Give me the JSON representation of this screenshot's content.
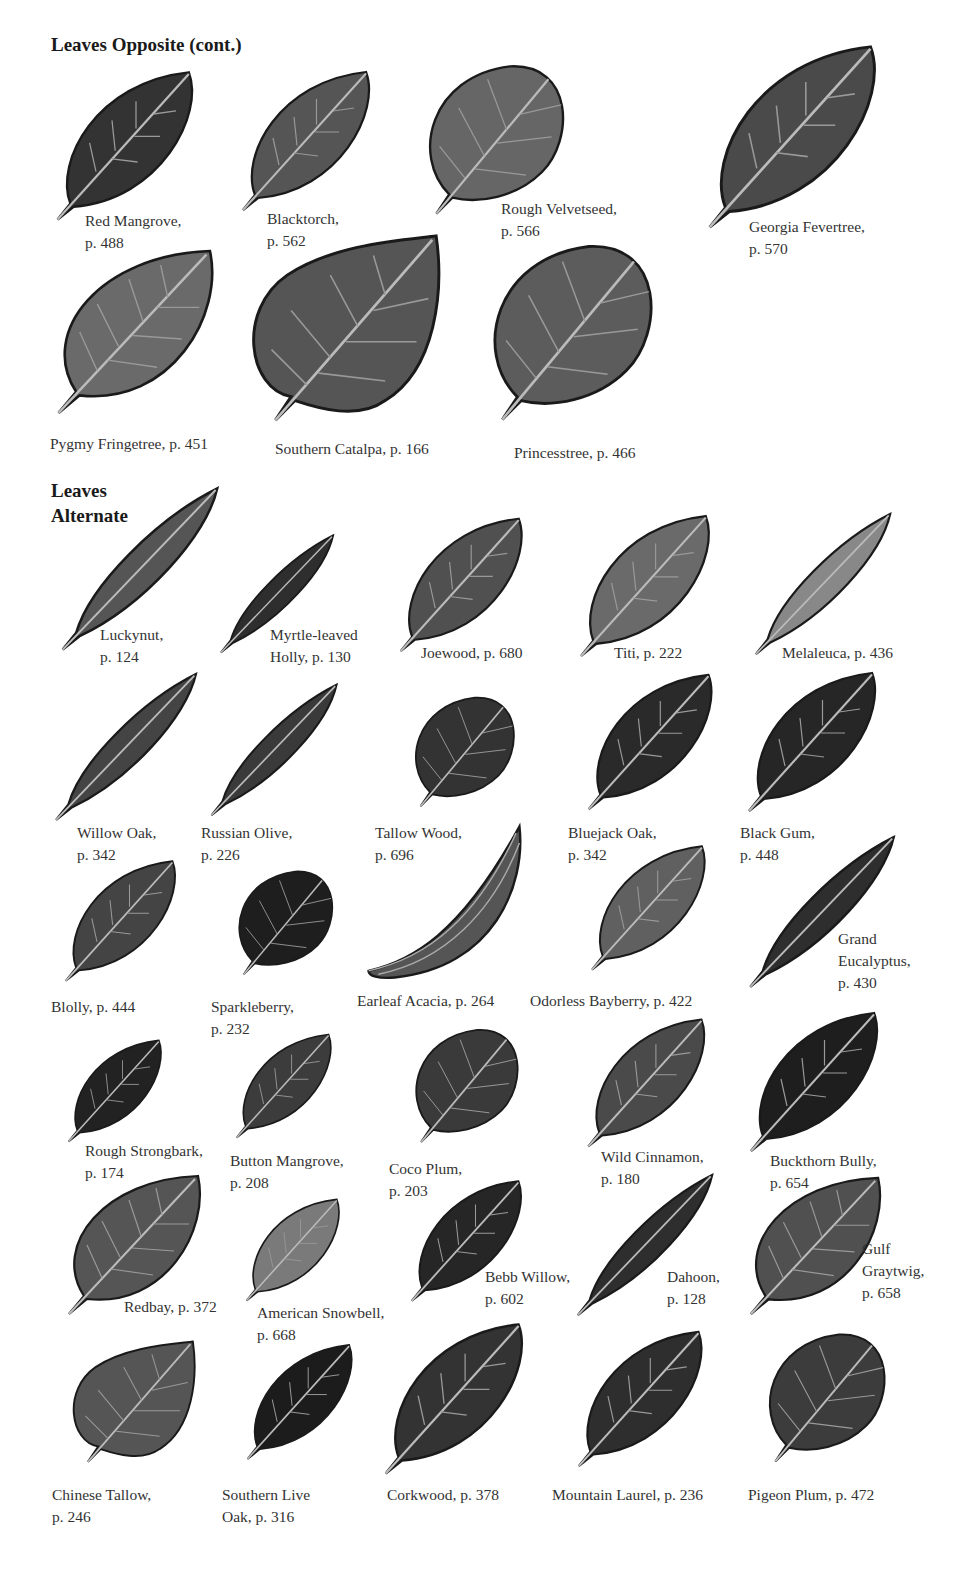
{
  "sections": [
    {
      "title": "Leaves Opposite (cont.)",
      "leaves": [
        {
          "name": "Red Mangrove",
          "page": "p. 488",
          "label_lines": [
            "Red Mangrove,",
            "p. 488"
          ]
        },
        {
          "name": "Blacktorch",
          "page": "p. 562",
          "label_lines": [
            "Blacktorch,",
            "p. 562"
          ]
        },
        {
          "name": "Rough Velvetseed",
          "page": "p. 566",
          "label_lines": [
            "Rough Velvetseed,",
            "p. 566"
          ]
        },
        {
          "name": "Georgia Fevertree",
          "page": "p. 570",
          "label_lines": [
            "Georgia Fevertree,",
            "p. 570"
          ]
        },
        {
          "name": "Pygmy Fringetree",
          "page": "p. 451",
          "label_lines": [
            "Pygmy Fringetree, p. 451"
          ]
        },
        {
          "name": "Southern Catalpa",
          "page": "p. 166",
          "label_lines": [
            "Southern Catalpa, p. 166"
          ]
        },
        {
          "name": "Princesstree",
          "page": "p. 466",
          "label_lines": [
            "Princesstree, p. 466"
          ]
        }
      ]
    },
    {
      "title_lines": [
        "Leaves",
        "Alternate"
      ],
      "leaves": [
        {
          "name": "Luckynut",
          "page": "p. 124",
          "label_lines": [
            "Luckynut,",
            "p. 124"
          ]
        },
        {
          "name": "Myrtle-leaved Holly",
          "page": "p. 130",
          "label_lines": [
            "Myrtle-leaved",
            "Holly, p. 130"
          ]
        },
        {
          "name": "Joewood",
          "page": "p. 680",
          "label_lines": [
            "Joewood, p. 680"
          ]
        },
        {
          "name": "Titi",
          "page": "p. 222",
          "label_lines": [
            "Titi, p. 222"
          ]
        },
        {
          "name": "Melaleuca",
          "page": "p. 436",
          "label_lines": [
            "Melaleuca, p. 436"
          ]
        },
        {
          "name": "Willow Oak",
          "page": "p. 342",
          "label_lines": [
            "Willow Oak,",
            "p. 342"
          ]
        },
        {
          "name": "Russian Olive",
          "page": "p. 226",
          "label_lines": [
            "Russian Olive,",
            "p. 226"
          ]
        },
        {
          "name": "Tallow Wood",
          "page": "p. 696",
          "label_lines": [
            "Tallow Wood,",
            "p. 696"
          ]
        },
        {
          "name": "Bluejack Oak",
          "page": "p. 342",
          "label_lines": [
            "Bluejack Oak,",
            "p. 342"
          ]
        },
        {
          "name": "Black Gum",
          "page": "p. 448",
          "label_lines": [
            "Black Gum,",
            "p. 448"
          ]
        },
        {
          "name": "Blolly",
          "page": "p. 444",
          "label_lines": [
            "Blolly, p. 444"
          ]
        },
        {
          "name": "Sparkleberry",
          "page": "p. 232",
          "label_lines": [
            "Sparkleberry,",
            "p. 232"
          ]
        },
        {
          "name": "Earleaf Acacia",
          "page": "p. 264",
          "label_lines": [
            "Earleaf Acacia, p. 264"
          ]
        },
        {
          "name": "Odorless Bayberry",
          "page": "p. 422",
          "label_lines": [
            "Odorless Bayberry, p. 422"
          ]
        },
        {
          "name": "Grand Eucalyptus",
          "page": "p. 430",
          "label_lines": [
            "Grand",
            "Eucalyptus,",
            "p. 430"
          ]
        },
        {
          "name": "Rough Strongbark",
          "page": "p. 174",
          "label_lines": [
            "Rough Strongbark,",
            "p. 174"
          ]
        },
        {
          "name": "Button Mangrove",
          "page": "p. 208",
          "label_lines": [
            "Button Mangrove,",
            "p. 208"
          ]
        },
        {
          "name": "Coco Plum",
          "page": "p. 203",
          "label_lines": [
            "Coco Plum,",
            "p. 203"
          ]
        },
        {
          "name": "Wild Cinnamon",
          "page": "p. 180",
          "label_lines": [
            "Wild Cinnamon,",
            "p. 180"
          ]
        },
        {
          "name": "Buckthorn Bully",
          "page": "p. 654",
          "label_lines": [
            "Buckthorn Bully,",
            "p. 654"
          ]
        },
        {
          "name": "Redbay",
          "page": "p. 372",
          "label_lines": [
            "Redbay, p. 372"
          ]
        },
        {
          "name": "American Snowbell",
          "page": "p. 668",
          "label_lines": [
            "American Snowbell,",
            "p. 668"
          ]
        },
        {
          "name": "Bebb Willow",
          "page": "p. 602",
          "label_lines": [
            "Bebb Willow,",
            "p. 602"
          ]
        },
        {
          "name": "Dahoon",
          "page": "p. 128",
          "label_lines": [
            "Dahoon,",
            "p. 128"
          ]
        },
        {
          "name": "Gulf Graytwig",
          "page": "p. 658",
          "label_lines": [
            "Gulf",
            "Graytwig,",
            "p. 658"
          ]
        },
        {
          "name": "Chinese Tallow",
          "page": "p. 246",
          "label_lines": [
            "Chinese Tallow,",
            "p. 246"
          ]
        },
        {
          "name": "Southern Live Oak",
          "page": "p. 316",
          "label_lines": [
            "Southern Live",
            "Oak, p. 316"
          ]
        },
        {
          "name": "Corkwood",
          "page": "p. 378",
          "label_lines": [
            "Corkwood, p. 378"
          ]
        },
        {
          "name": "Mountain Laurel",
          "page": "p. 236",
          "label_lines": [
            "Mountain Laurel, p. 236"
          ]
        },
        {
          "name": "Pigeon Plum",
          "page": "p. 472",
          "label_lines": [
            "Pigeon Plum, p. 472"
          ]
        }
      ]
    }
  ]
}
